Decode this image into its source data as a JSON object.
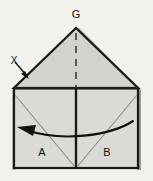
{
  "figure": {
    "kind": "origami-fold-diagram",
    "background_color": "#f3f1ec",
    "paper_fill": "#d4d2cd",
    "paper_fill_light": "#dcdad5",
    "outline_color": "#1a1a1a",
    "crease_color": "#7a7873",
    "arrow_color": "#111111",
    "labels": {
      "apex": "G",
      "left_panel": "A",
      "right_panel": "B",
      "fold_marker": "X"
    },
    "icons": {
      "fold_arrow": "arrow-down-right-icon",
      "curved_fold_arrow": "curved-arrow-left-icon",
      "valley_crease": "dashed-line-icon"
    },
    "geometry": {
      "apex": [
        76,
        28
      ],
      "roof_left_corner": [
        14,
        88
      ],
      "roof_right_corner": [
        138,
        88
      ],
      "base_bottom": 168,
      "center_x": 76
    }
  }
}
